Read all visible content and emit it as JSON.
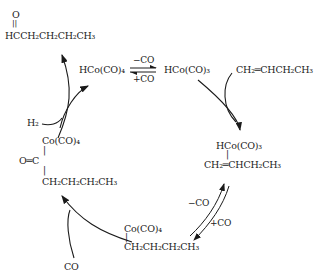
{
  "diagram": {
    "type": "catalytic-cycle",
    "topic": "hydroformylation of 1-butene with HCo(CO)4",
    "species": {
      "aldehyde_o": "O",
      "aldehyde_bond": "||",
      "aldehyde": "HCCH₂CH₂CH₂CH₃",
      "catalyst": "HCo(CO)₄",
      "active_catalyst": "HCo(CO)₃",
      "alkene": "CH₂═CHCH₂CH₃",
      "pi_complex_top": "HCo(CO)₃",
      "pi_complex_bond": "|",
      "pi_complex_bottom": "CH₂═CHCH₂CH₃",
      "alkyl_top": "Co(CO)₄",
      "alkyl_bond": "|",
      "alkyl_bottom": "CH₂CH₂CH₂CH₃",
      "acyl_top": "Co(CO)₄",
      "acyl_bond1": "|",
      "acyl_mid": "O═C",
      "acyl_bond2": "|",
      "acyl_bottom": "CH₂CH₂CH₂CH₃"
    },
    "reagents": {
      "h2": "H₂",
      "co_in": "CO"
    },
    "equilibria": {
      "top_forward": "−CO",
      "top_reverse": "+CO",
      "right_forward": "−CO",
      "right_reverse": "+CO"
    }
  }
}
